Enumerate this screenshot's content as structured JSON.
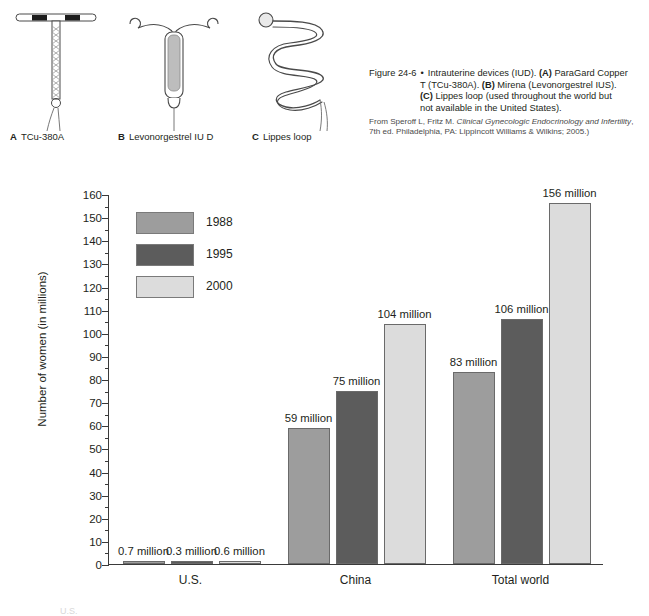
{
  "figure": {
    "devices": [
      {
        "letter": "A",
        "label": "TCu-380A",
        "icon": "iud-copper-t-icon"
      },
      {
        "letter": "B",
        "label": "Levonorgestrel IU D",
        "icon": "iud-levonorgestrel-icon"
      },
      {
        "letter": "C",
        "label": "Lippes loop",
        "icon": "iud-lippes-loop-icon"
      }
    ],
    "caption": {
      "number": "Figure 24-6",
      "bullet": "•",
      "line1_lead": "Intrauterine devices (IUD). ",
      "a_tag": "(A)",
      "line1_rest": " ParaGard Copper",
      "line2_lead": "T (TCu-380A). ",
      "b_tag": "(B)",
      "line2_rest": " Mirena (Levonorgestrel IUS).",
      "c_tag": "(C)",
      "line3_rest": " Lippes loop (used throughout the world but",
      "line4": "not available in the United States).",
      "source_pre": "From Speroff L, Fritz M. ",
      "source_italic": "Clinical Gynecologic Endocrinology and Infertility",
      "source_post": ", 7th ed. Philadelphia, PA: Lippincott Williams & Wilkins; 2005.)"
    }
  },
  "chart_data": {
    "type": "bar",
    "title": "",
    "xlabel": "",
    "ylabel": "Number of women (in millions)",
    "ylim": [
      0,
      160
    ],
    "ytick_step": 10,
    "yticks": [
      0,
      10,
      20,
      30,
      40,
      50,
      60,
      70,
      80,
      90,
      100,
      110,
      120,
      130,
      140,
      150,
      160
    ],
    "ytick_labels": [
      "0",
      "10",
      "20",
      "30",
      "40",
      "50",
      "60",
      "70",
      "80",
      "90",
      "100",
      "110",
      "120",
      "130",
      "140",
      "150",
      "160"
    ],
    "grid": false,
    "legend_position": "upper-left-inside",
    "categories": [
      "U.S.",
      "China",
      "Total world"
    ],
    "series": [
      {
        "name": "1988",
        "color": "#9d9d9d",
        "values": [
          0.7,
          59,
          83
        ],
        "labels": [
          "0.7 million",
          "59 million",
          "83 million"
        ]
      },
      {
        "name": "1995",
        "color": "#5c5c5c",
        "values": [
          0.3,
          75,
          106
        ],
        "labels": [
          "0.3 million",
          "75 million",
          "106 million"
        ]
      },
      {
        "name": "2000",
        "color": "#dcdcdc",
        "values": [
          0.6,
          104,
          156
        ],
        "labels": [
          "0.6 million",
          "104 million",
          "156 million"
        ]
      }
    ]
  },
  "footnote": "U.S."
}
